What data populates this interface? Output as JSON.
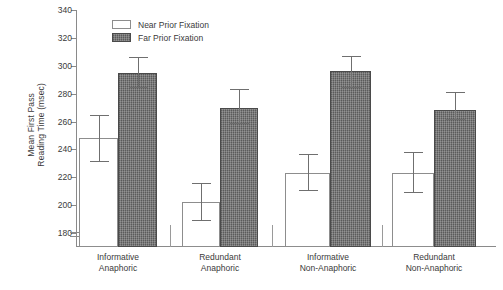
{
  "chart_data": {
    "type": "bar",
    "title": "",
    "xlabel": "",
    "ylabel": "Mean First Pass Reading Time (msec)",
    "ylabel_lines": [
      "Mean First Pass",
      "Reading Time (msec)"
    ],
    "ylim": [
      170,
      340
    ],
    "yticks": [
      180,
      200,
      220,
      240,
      260,
      280,
      300,
      320,
      340
    ],
    "ytick_labels": [
      "180",
      "200",
      "220",
      "240",
      "260",
      "280",
      "300",
      "320",
      "340"
    ],
    "axis_break": true,
    "grid": false,
    "legend_position": "top-left-inside",
    "categories": [
      "Informative Anaphoric",
      "Redundant Anaphoric",
      "Informative Non-Anaphoric",
      "Redundant Non-Anaphoric"
    ],
    "category_lines": [
      [
        "Informative",
        "Anaphoric"
      ],
      [
        "Redundant",
        "Anaphoric"
      ],
      [
        "Informative",
        "Non-Anaphoric"
      ],
      [
        "Redundant",
        "Non-Anaphoric"
      ]
    ],
    "series": [
      {
        "name": "Near Prior Fixation",
        "color": "#ffffff",
        "values": [
          248,
          202,
          223,
          223
        ],
        "error_low": [
          231,
          189,
          210,
          209
        ],
        "error_high": [
          265,
          216,
          237,
          238
        ]
      },
      {
        "name": "Far Prior Fixation",
        "color": "#6e6e6e",
        "values": [
          295,
          270,
          296,
          268
        ],
        "error_low": [
          284,
          258,
          284,
          261
        ],
        "error_high": [
          306,
          283,
          307,
          281
        ]
      }
    ]
  },
  "legend": {
    "items": [
      {
        "label": "Near Prior Fixation",
        "style": "near"
      },
      {
        "label": "Far Prior Fixation",
        "style": "far"
      }
    ]
  }
}
